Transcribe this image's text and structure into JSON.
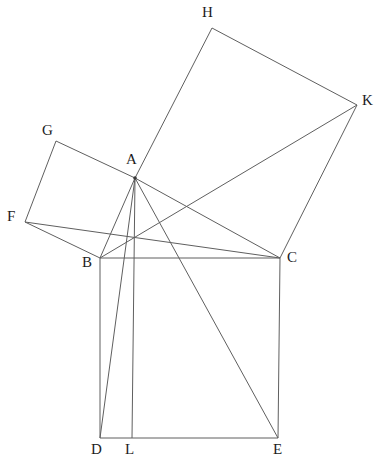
{
  "figure": {
    "background_color": "#ffffff",
    "line_color": "#5f5f5f",
    "label_color": "#1c1c1c",
    "width": 381,
    "height": 466,
    "points": {
      "A": {
        "label": "A",
        "x": 135,
        "y": 178,
        "label_x": 126,
        "label_y": 152
      },
      "B": {
        "label": "B",
        "x": 100,
        "y": 258,
        "label_x": 82,
        "label_y": 255
      },
      "C": {
        "label": "C",
        "x": 280,
        "y": 258,
        "label_x": 287,
        "label_y": 250
      },
      "D": {
        "label": "D",
        "x": 100,
        "y": 438,
        "label_x": 91,
        "label_y": 442
      },
      "E": {
        "label": "E",
        "x": 278,
        "y": 438,
        "label_x": 273,
        "label_y": 442
      },
      "F": {
        "label": "F",
        "x": 25,
        "y": 222,
        "label_x": 7,
        "label_y": 209
      },
      "G": {
        "label": "G",
        "x": 56,
        "y": 141,
        "label_x": 42,
        "label_y": 123
      },
      "H": {
        "label": "H",
        "x": 212,
        "y": 28,
        "label_x": 202,
        "label_y": 5
      },
      "K": {
        "label": "K",
        "x": 357,
        "y": 105,
        "label_x": 362,
        "label_y": 93
      },
      "L": {
        "label": "L",
        "x": 132,
        "y": 438,
        "label_x": 125,
        "label_y": 442
      }
    },
    "segments": [
      {
        "name": "triangle-side-AB",
        "from": "A",
        "to": "B"
      },
      {
        "name": "triangle-side-AC",
        "from": "A",
        "to": "C"
      },
      {
        "name": "triangle-side-BC",
        "from": "B",
        "to": "C"
      },
      {
        "name": "square-BDEC-side-BD",
        "from": "B",
        "to": "D"
      },
      {
        "name": "square-BDEC-side-DE",
        "from": "D",
        "to": "E"
      },
      {
        "name": "square-BDEC-side-EC",
        "from": "E",
        "to": "C"
      },
      {
        "name": "square-ABFG-side-BF",
        "from": "B",
        "to": "F"
      },
      {
        "name": "square-ABFG-side-FG",
        "from": "F",
        "to": "G"
      },
      {
        "name": "square-ABFG-side-GA",
        "from": "G",
        "to": "A"
      },
      {
        "name": "square-ACKH-side-AH",
        "from": "A",
        "to": "H"
      },
      {
        "name": "square-ACKH-side-HK",
        "from": "H",
        "to": "K"
      },
      {
        "name": "square-ACKH-side-KC",
        "from": "K",
        "to": "C"
      },
      {
        "name": "construction-line-AL",
        "from": "A",
        "to": "L"
      },
      {
        "name": "construction-line-AD",
        "from": "A",
        "to": "D"
      },
      {
        "name": "construction-line-AE",
        "from": "A",
        "to": "E"
      },
      {
        "name": "construction-line-FC",
        "from": "F",
        "to": "C"
      },
      {
        "name": "construction-line-BK",
        "from": "B",
        "to": "K"
      }
    ]
  }
}
